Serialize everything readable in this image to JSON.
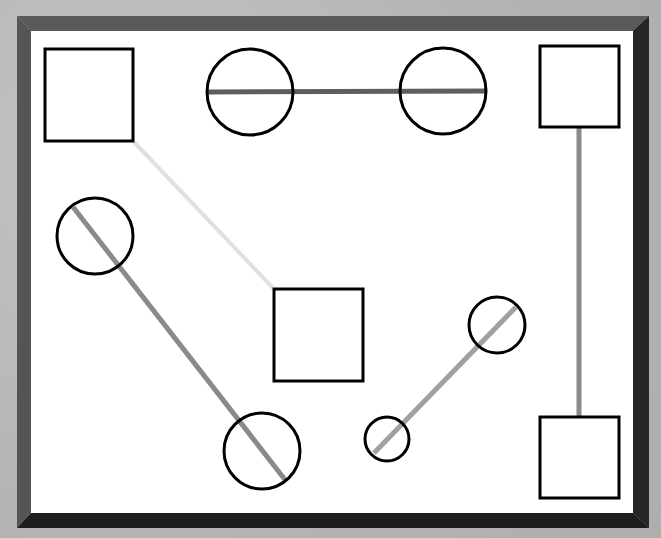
{
  "diagram": {
    "title": "",
    "colors": {
      "background": "#b9b9b9",
      "board": "#ffffff",
      "frame_top": "#5a5a5a",
      "frame_left": "#555555",
      "frame_right": "#262626",
      "frame_bottom": "#1e1e1e",
      "shape_stroke": "#000000",
      "line_dark": "#5e5e5e",
      "line_mid": "#8a8a8a",
      "line_light": "#a0a0a0",
      "line_faint": "#e0e0e0"
    },
    "nodes": [
      {
        "id": "square-top-left",
        "shape": "square"
      },
      {
        "id": "circle-top-left",
        "shape": "circle"
      },
      {
        "id": "circle-top-right",
        "shape": "circle"
      },
      {
        "id": "square-top-right",
        "shape": "square"
      },
      {
        "id": "circle-mid-left",
        "shape": "circle"
      },
      {
        "id": "square-center",
        "shape": "square"
      },
      {
        "id": "circle-mid-right",
        "shape": "circle"
      },
      {
        "id": "circle-bottom-small",
        "shape": "circle"
      },
      {
        "id": "circle-bottom-left",
        "shape": "circle"
      },
      {
        "id": "square-bottom-right",
        "shape": "square"
      }
    ],
    "edges": [
      {
        "from": "square-top-left",
        "to": "square-center",
        "shade": "faint"
      },
      {
        "from": "circle-top-left",
        "to": "circle-top-right",
        "shade": "dark"
      },
      {
        "from": "square-top-right",
        "to": "square-bottom-right",
        "shade": "mid"
      },
      {
        "from": "circle-mid-left",
        "to": "circle-bottom-left",
        "shade": "mid"
      },
      {
        "from": "circle-bottom-small",
        "to": "circle-mid-right",
        "shade": "light"
      }
    ]
  }
}
